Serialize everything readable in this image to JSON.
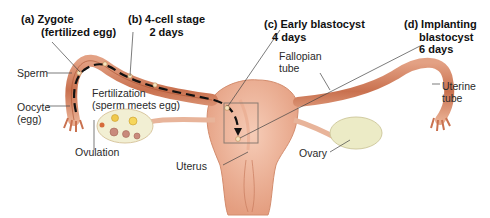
{
  "diagram": {
    "stages": [
      {
        "id": "a",
        "line1": "(a) Zygote",
        "line2": "(fertilized egg)"
      },
      {
        "id": "b",
        "line1": "(b) 4-cell stage",
        "line2": "2 days"
      },
      {
        "id": "c",
        "line1": "(c) Early blastocyst",
        "line2": "4 days"
      },
      {
        "id": "d",
        "line1": "(d) Implanting",
        "line2": "blastocyst",
        "line3": "6 days"
      }
    ],
    "labels": {
      "sperm": "Sperm",
      "oocyte_line1": "Oocyte",
      "oocyte_line2": "(egg)",
      "fertilization_line1": "Fertilization",
      "fertilization_line2": "(sperm meets egg)",
      "ovulation": "Ovulation",
      "uterus": "Uterus",
      "fallopian_line1": "Fallopian",
      "fallopian_line2": "tube",
      "uterine_tube_line1": "Uterine",
      "uterine_tube_line2": "tube",
      "ovary": "Ovary"
    },
    "colors": {
      "tissue": "#d98a6a",
      "tissue_dark": "#b8623f",
      "uterus_fill": "#f0b9a0",
      "ovary_fill": "#ecebc6",
      "arrow": "#111111",
      "leader_line": "#444444"
    }
  }
}
